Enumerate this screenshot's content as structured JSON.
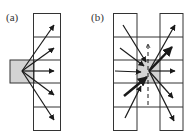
{
  "figure": {
    "panels": [
      {
        "id": "a",
        "label": "(a)",
        "description": "A gray source cell to the left of a vertical column of five cells; arrows fan out from the source to each of the five cells.",
        "source_cell": {
          "x": 10,
          "y": 60,
          "w": 24,
          "h": 23,
          "fill": "#d3d3d3"
        },
        "column": {
          "x": 33,
          "y": 13,
          "w": 27,
          "rows": 5,
          "row_h": 23.4
        },
        "arrows": [
          {
            "from": [
              32,
              71
            ],
            "to": [
              54,
              25
            ],
            "weight": "normal"
          },
          {
            "from": [
              32,
              71
            ],
            "to": [
              54,
              48
            ],
            "weight": "normal"
          },
          {
            "from": [
              32,
              71
            ],
            "to": [
              54,
              71
            ],
            "weight": "normal"
          },
          {
            "from": [
              32,
              71
            ],
            "to": [
              54,
              95
            ],
            "weight": "normal"
          },
          {
            "from": [
              32,
              71
            ],
            "to": [
              54,
              120
            ],
            "weight": "normal"
          }
        ]
      },
      {
        "id": "b",
        "label": "(b)",
        "description": "Two vertical columns of five cells connected by horizontal lines; a gray central cell receives arrows from the left column and emits arrows to the right column, with a dashed vertical arrow through it.",
        "center_cell": {
          "x": 137,
          "y": 60,
          "w": 23,
          "h": 23,
          "fill": "#d3d3d3"
        },
        "left_column": {
          "x": 113,
          "y": 13,
          "w": 24,
          "rows": 5
        },
        "right_column": {
          "x": 160,
          "y": 13,
          "w": 23,
          "rows": 5
        },
        "arrows": [
          {
            "from": [
              123,
              25
            ],
            "to": [
              146,
              62
            ],
            "weight": "normal",
            "style": "solid"
          },
          {
            "from": [
              120,
              48
            ],
            "to": [
              144,
              66
            ],
            "weight": "normal",
            "style": "solid"
          },
          {
            "from": [
              113,
              71
            ],
            "to": [
              141,
              72
            ],
            "weight": "normal",
            "style": "solid"
          },
          {
            "from": [
              124,
              96
            ],
            "to": [
              147,
              76
            ],
            "weight": "bold",
            "style": "solid"
          },
          {
            "from": [
              125,
              118
            ],
            "to": [
              141,
              86
            ],
            "weight": "normal",
            "style": "solid"
          },
          {
            "from": [
              149,
              71
            ],
            "to": [
              175,
              25
            ],
            "weight": "normal",
            "style": "solid"
          },
          {
            "from": [
              149,
              71
            ],
            "to": [
              173,
              46
            ],
            "weight": "bold",
            "style": "solid"
          },
          {
            "from": [
              149,
              71
            ],
            "to": [
              175,
              71
            ],
            "weight": "normal",
            "style": "solid"
          },
          {
            "from": [
              149,
              71
            ],
            "to": [
              173,
              98
            ],
            "weight": "normal",
            "style": "solid"
          },
          {
            "from": [
              149,
              71
            ],
            "to": [
              174,
              121
            ],
            "weight": "normal",
            "style": "solid"
          },
          {
            "from": [
              148,
              105
            ],
            "to": [
              148,
              44
            ],
            "weight": "normal",
            "style": "dashed"
          }
        ]
      }
    ],
    "colors": {
      "line": "#1a1a1a",
      "grid": "#333333",
      "cell_fill": "#d3d3d3",
      "background": "#ffffff"
    }
  }
}
